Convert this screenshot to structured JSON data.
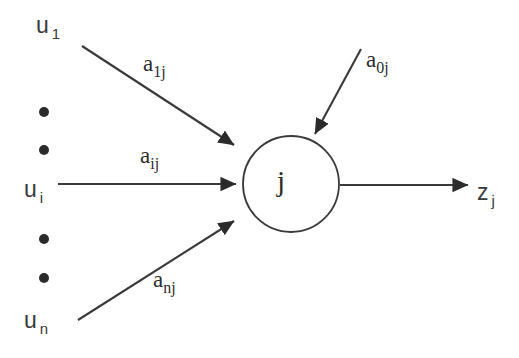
{
  "diagram": {
    "type": "neural-unit-schematic",
    "colors": {
      "background": "#ffffff",
      "stroke": "#3a3a3a",
      "text": "#2b2b2b"
    },
    "node": {
      "label": "j",
      "shape": "circle",
      "center_x": 291,
      "center_y": 184,
      "radius": 48
    },
    "inputs": [
      {
        "name": "input-u1",
        "label": "u",
        "subscript": "1",
        "weight_label": "a",
        "weight_subscript": "1j",
        "x": 36,
        "y": 14
      },
      {
        "name": "input-ui",
        "label": "u",
        "subscript": "i",
        "weight_label": "a",
        "weight_subscript": "ij",
        "x": 24,
        "y": 178
      },
      {
        "name": "input-un",
        "label": "u",
        "subscript": "n",
        "weight_label": "a",
        "weight_subscript": "nj",
        "x": 24,
        "y": 309
      }
    ],
    "bias": {
      "name": "bias-input",
      "weight_label": "a",
      "weight_subscript": "0j"
    },
    "output": {
      "name": "output-zj",
      "label": "z",
      "subscript": "j"
    },
    "ellipsis_dots": [
      {
        "cx": 44,
        "cy": 112,
        "r": 5
      },
      {
        "cx": 44,
        "cy": 150,
        "r": 5
      },
      {
        "cx": 44,
        "cy": 239,
        "r": 5
      },
      {
        "cx": 44,
        "cy": 278,
        "r": 5
      }
    ]
  }
}
